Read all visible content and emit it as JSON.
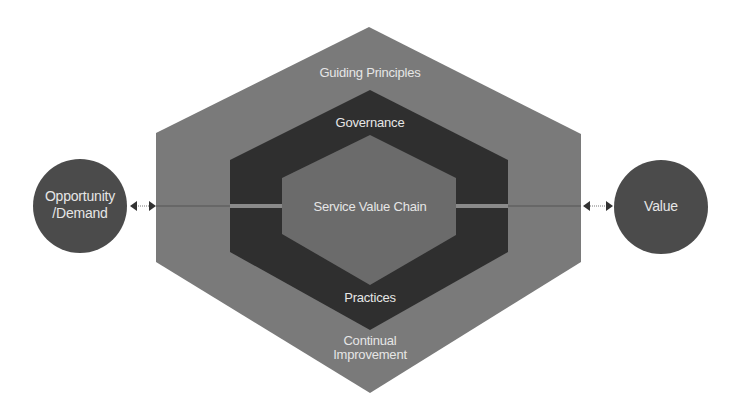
{
  "diagram": {
    "colors": {
      "background": "#ffffff",
      "outer_hexagon": "#7a7a7a",
      "governance_band": "#2f2f2f",
      "inner_hexagon": "#6b6b6b",
      "circles": "#4b4b4b",
      "label_text": "#e6e6e6",
      "connector": "#555555",
      "connector_band": "#8a8a8a"
    },
    "layers": {
      "outer": {
        "label": "Guiding Principles",
        "bottom_label_line1": "Continual",
        "bottom_label_line2": "Improvement"
      },
      "middle": {
        "label": "Governance",
        "bottom_label": "Practices"
      },
      "inner": {
        "label": "Service Value Chain"
      }
    },
    "input": {
      "label_line1": "Opportunity",
      "label_line2": "/Demand"
    },
    "output": {
      "label": "Value"
    },
    "connectors": [
      {
        "from": "Opportunity/Demand",
        "to": "Service Value System",
        "type": "bidirectional-arrow"
      },
      {
        "from": "Service Value System",
        "to": "Value",
        "type": "bidirectional-arrow"
      }
    ]
  }
}
